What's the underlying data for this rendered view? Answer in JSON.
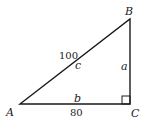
{
  "diagram": {
    "type": "right-triangle",
    "vertices": {
      "A": {
        "label": "A"
      },
      "B": {
        "label": "B"
      },
      "C": {
        "label": "C"
      }
    },
    "sides": {
      "c": {
        "label": "c",
        "value": "100"
      },
      "a": {
        "label": "a"
      },
      "b": {
        "label": "b",
        "value": "80"
      }
    },
    "right_angle_at": "C",
    "stroke_color": "#1a1a1a"
  }
}
